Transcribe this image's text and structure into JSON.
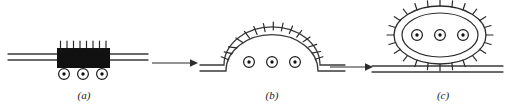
{
  "figure": {
    "background_color": "#ffffff",
    "ink_color": "#2b2b2b",
    "coat_block_color": "#111111",
    "width": 511,
    "height": 110
  },
  "panels": [
    {
      "id": "a",
      "label": "(a)",
      "label_x": 84,
      "label_y": 99,
      "stage": "flat-membrane-with-coat",
      "description": "Flat bilayer membrane with a solid black coat block bearing upright spikes; three cargo receptors below",
      "membrane": {
        "type": "flat-bilayer",
        "x_start": 8,
        "x_end": 148,
        "upper_line_y": 54,
        "lower_line_y": 60
      },
      "coat": {
        "shape": "rectangle",
        "x": 57,
        "y": 48,
        "width": 53,
        "height": 20,
        "spike_count": 8,
        "spike_length": 7,
        "spike_orientation": "vertical-up"
      },
      "cargo": {
        "count": 3,
        "radius": 5.4,
        "dot_radius": 1.7,
        "y": 74,
        "x_positions": [
          64,
          83,
          102
        ]
      }
    },
    {
      "id": "b",
      "label": "(b)",
      "label_x": 272,
      "label_y": 99,
      "stage": "invaginated-dome-bud",
      "description": "Membrane invaginated into a coated dome with radiating spikes; three cargo receptors inside the bud neck",
      "membrane": {
        "type": "flat-bilayer-with-dome",
        "x_start": 200,
        "x_end": 345,
        "upper_line_y": 65,
        "lower_line_y": 71
      },
      "dome": {
        "center_x": 272,
        "base_y": 65,
        "radius_x": 44,
        "radius_y": 35,
        "spike_count": 15,
        "spike_length": 8
      },
      "cargo": {
        "count": 3,
        "radius": 5.4,
        "dot_radius": 1.7,
        "y": 62,
        "x_positions": [
          249,
          272,
          295
        ]
      }
    },
    {
      "id": "c",
      "label": "(c)",
      "label_x": 443,
      "label_y": 99,
      "stage": "pinched-off-coated-vesicle",
      "description": "Coated vesicle released from the resealed flat membrane; double-walled ellipse with radiating spikes holding three cargo receptors",
      "membrane": {
        "type": "flat-bilayer",
        "x_start": 372,
        "x_end": 500,
        "upper_line_y": 66,
        "lower_line_y": 72
      },
      "vesicle": {
        "center_x": 440,
        "center_y": 35,
        "outer_radius_x": 46,
        "outer_radius_y": 29,
        "inner_radius_x": 38,
        "inner_radius_y": 22,
        "spike_count": 24,
        "spike_length": 7
      },
      "cargo": {
        "count": 3,
        "radius": 5.4,
        "dot_radius": 1.7,
        "y": 35,
        "x_positions": [
          417,
          440,
          463
        ]
      }
    }
  ],
  "arrows": [
    {
      "id": "arrow-a-to-b",
      "x_start": 152,
      "x_end": 196,
      "y": 63,
      "direction": "right"
    },
    {
      "id": "arrow-b-to-c",
      "x_start": 330,
      "x_end": 372,
      "y": 67,
      "direction": "right"
    }
  ]
}
